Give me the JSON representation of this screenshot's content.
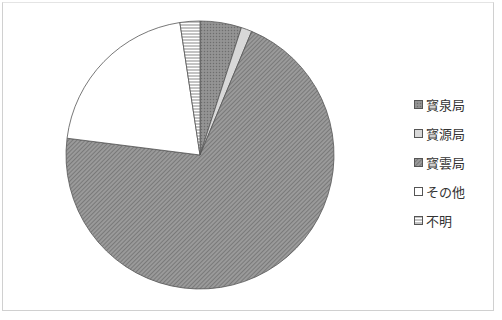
{
  "chart_data": {
    "type": "pie",
    "title": "",
    "start_angle_deg": 0,
    "direction": "clockwise",
    "categories": [
      "寳泉局",
      "寳源局",
      "寳雲局",
      "その他",
      "不明"
    ],
    "values": [
      5.0,
      1.3,
      70.7,
      20.6,
      2.4
    ],
    "unit": "%",
    "legend_position": "right",
    "patterns": [
      "dense-gray-dots",
      "light-gray",
      "diagonal-hatch",
      "white",
      "horizontal-lines"
    ]
  },
  "legend": {
    "items": [
      {
        "label": "寳泉局"
      },
      {
        "label": "寳源局"
      },
      {
        "label": "寳雲局"
      },
      {
        "label": "その他"
      },
      {
        "label": "不明"
      }
    ]
  },
  "colors": {
    "slice_dark": "#8a8a8a",
    "slice_light": "#d8d8d8",
    "slice_hatch": "#7a7a7a",
    "slice_white": "#ffffff",
    "outline": "#555555"
  }
}
